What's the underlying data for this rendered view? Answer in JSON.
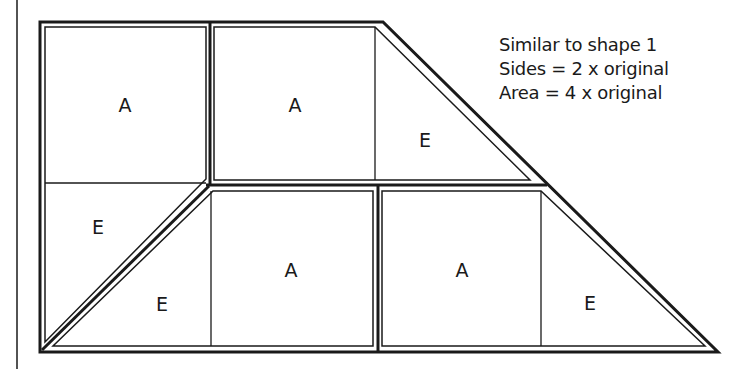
{
  "diagram": {
    "caption": {
      "line1": "Similar to shape 1",
      "line2": "Sides = 2 x original",
      "line3": "Area = 4 x original"
    },
    "pieces": [
      {
        "id": "top-left",
        "labels": [
          "A",
          "E"
        ]
      },
      {
        "id": "top-right",
        "labels": [
          "A",
          "E"
        ]
      },
      {
        "id": "bottom-left",
        "labels": [
          "E",
          "A"
        ]
      },
      {
        "id": "bottom-right",
        "labels": [
          "A",
          "E"
        ]
      }
    ],
    "tile_labels": {
      "a1": "A",
      "a2": "A",
      "a3": "A",
      "a4": "A",
      "e1": "E",
      "e2": "E",
      "e3": "E",
      "e4": "E"
    },
    "colors": {
      "line": "#1a1a1a",
      "background": "#ffffff"
    }
  }
}
